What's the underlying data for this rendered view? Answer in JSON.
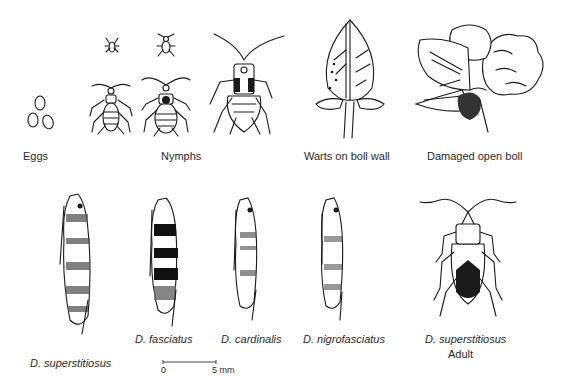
{
  "figure": {
    "top_row": [
      {
        "id": "eggs",
        "label": "Eggs"
      },
      {
        "id": "nymphs",
        "label": "Nymphs"
      },
      {
        "id": "warts",
        "label": "Warts on boll wall"
      },
      {
        "id": "damaged",
        "label": "Damaged open boll"
      }
    ],
    "bottom_row": [
      {
        "id": "d-superstitiosus",
        "label": "D. superstitiosus",
        "italic": true
      },
      {
        "id": "d-fasciatus",
        "label": "D. fasciatus",
        "italic": true
      },
      {
        "id": "d-cardinalis",
        "label": "D. cardinalis",
        "italic": true
      },
      {
        "id": "d-nigrofasciatus",
        "label": "D. nigrofasciatus",
        "italic": true
      },
      {
        "id": "adult",
        "label": "D. superstitiosus",
        "sublabel": "Adult",
        "italic": true
      }
    ],
    "scale_bar": {
      "start": "0",
      "end": "5 mm"
    }
  }
}
